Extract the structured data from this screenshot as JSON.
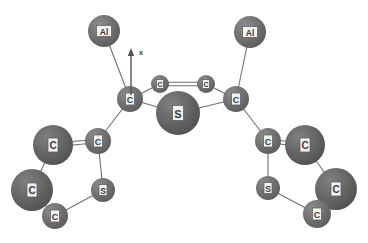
{
  "figure": {
    "type": "ball-and-stick-molecular-model",
    "width": 368,
    "height": 243,
    "background_color": "#ffffff"
  },
  "axis": {
    "label": "x",
    "label_x": 141,
    "label_y": 52,
    "arrow_tail_x": 131,
    "arrow_tail_y": 95,
    "arrow_tip_x": 131,
    "arrow_tip_y": 48,
    "color": "#555555"
  },
  "style": {
    "atom_fill_color": "#6e6e6e",
    "atom_fill_color_dark": "#636363",
    "bond_color": "#6f6f6f",
    "label_box_fill": "#f2f2f2",
    "label_text_color": "#3a3a3a"
  },
  "atoms": [
    {
      "id": "al-left",
      "element": "Al",
      "label": "Al",
      "x": 104,
      "y": 31,
      "r": 16,
      "font_size": 8.5,
      "box_w": 15,
      "box_h": 11,
      "shade": "#6e6e6e"
    },
    {
      "id": "al-right",
      "element": "Al",
      "label": "Al",
      "x": 250,
      "y": 32,
      "r": 16,
      "font_size": 8.5,
      "box_w": 15,
      "box_h": 11,
      "shade": "#6e6e6e"
    },
    {
      "id": "c-core-left",
      "element": "C",
      "label": "C",
      "x": 130,
      "y": 99,
      "r": 13,
      "font_size": 9,
      "box_w": 9,
      "box_h": 12,
      "shade": "#6e6e6e"
    },
    {
      "id": "c-core-right",
      "element": "C",
      "label": "C",
      "x": 236,
      "y": 99,
      "r": 13,
      "font_size": 9,
      "box_w": 9,
      "box_h": 12,
      "shade": "#6e6e6e"
    },
    {
      "id": "c-ring-top-left",
      "element": "C",
      "label": "C",
      "x": 160,
      "y": 84,
      "r": 9,
      "font_size": 7,
      "box_w": 7,
      "box_h": 9,
      "shade": "#6e6e6e"
    },
    {
      "id": "c-ring-top-right",
      "element": "C",
      "label": "C",
      "x": 206,
      "y": 84,
      "r": 9,
      "font_size": 7,
      "box_w": 7,
      "box_h": 9,
      "shade": "#6e6e6e"
    },
    {
      "id": "s-center",
      "element": "S",
      "label": "S",
      "x": 178,
      "y": 113,
      "r": 22,
      "font_size": 11,
      "box_w": 11,
      "box_h": 15,
      "shade": "#636363"
    },
    {
      "id": "c-left-beta",
      "element": "C",
      "label": "C",
      "x": 98,
      "y": 141,
      "r": 13,
      "font_size": 9,
      "box_w": 9,
      "box_h": 12,
      "shade": "#6e6e6e"
    },
    {
      "id": "c-left-alpha",
      "element": "C",
      "label": "C",
      "x": 53,
      "y": 145,
      "r": 20,
      "font_size": 10,
      "box_w": 10,
      "box_h": 14,
      "shade": "#636363"
    },
    {
      "id": "c-left-gamma",
      "element": "C",
      "label": "C",
      "x": 32,
      "y": 190,
      "r": 21,
      "font_size": 10,
      "box_w": 10,
      "box_h": 14,
      "shade": "#636363"
    },
    {
      "id": "c-left-delta",
      "element": "C",
      "label": "C",
      "x": 55,
      "y": 216,
      "r": 13,
      "font_size": 9,
      "box_w": 9,
      "box_h": 12,
      "shade": "#6e6e6e"
    },
    {
      "id": "s-left",
      "element": "S",
      "label": "S",
      "x": 103,
      "y": 190,
      "r": 12,
      "font_size": 8.5,
      "box_w": 8,
      "box_h": 11,
      "shade": "#6e6e6e"
    },
    {
      "id": "c-right-beta",
      "element": "C",
      "label": "C",
      "x": 268,
      "y": 141,
      "r": 13,
      "font_size": 9,
      "box_w": 9,
      "box_h": 12,
      "shade": "#6e6e6e"
    },
    {
      "id": "c-right-alpha",
      "element": "C",
      "label": "C",
      "x": 305,
      "y": 145,
      "r": 20,
      "font_size": 10,
      "box_w": 10,
      "box_h": 14,
      "shade": "#636363"
    },
    {
      "id": "c-right-gamma",
      "element": "C",
      "label": "C",
      "x": 336,
      "y": 189,
      "r": 21,
      "font_size": 10,
      "box_w": 10,
      "box_h": 14,
      "shade": "#636363"
    },
    {
      "id": "c-right-delta",
      "element": "C",
      "label": "C",
      "x": 317,
      "y": 214,
      "r": 14,
      "font_size": 9,
      "box_w": 9,
      "box_h": 12,
      "shade": "#636363"
    },
    {
      "id": "s-right",
      "element": "S",
      "label": "S",
      "x": 268,
      "y": 188,
      "r": 12,
      "font_size": 8.5,
      "box_w": 8,
      "box_h": 11,
      "shade": "#6e6e6e"
    }
  ],
  "bonds": [
    {
      "id": "b-al-left",
      "from": "al-left",
      "to": "c-core-left",
      "order": 1
    },
    {
      "id": "b-al-right",
      "from": "al-right",
      "to": "c-core-right",
      "order": 1
    },
    {
      "id": "b-core-l-ringtop",
      "from": "c-core-left",
      "to": "c-ring-top-left",
      "order": 1
    },
    {
      "id": "b-core-l-s",
      "from": "c-core-left",
      "to": "s-center",
      "order": 1
    },
    {
      "id": "b-ringtop-double",
      "from": "c-ring-top-left",
      "to": "c-ring-top-right",
      "order": 2
    },
    {
      "id": "b-core-r-ringtop",
      "from": "c-ring-top-right",
      "to": "c-core-right",
      "order": 1
    },
    {
      "id": "b-core-r-s",
      "from": "s-center",
      "to": "c-core-right",
      "order": 1
    },
    {
      "id": "b-core-l-beta",
      "from": "c-core-left",
      "to": "c-left-beta",
      "order": 1
    },
    {
      "id": "b-l-beta-alpha",
      "from": "c-left-beta",
      "to": "c-left-alpha",
      "order": 2
    },
    {
      "id": "b-l-alpha-gamma",
      "from": "c-left-alpha",
      "to": "c-left-gamma",
      "order": 1
    },
    {
      "id": "b-l-gamma-delta",
      "from": "c-left-gamma",
      "to": "c-left-delta",
      "order": 1
    },
    {
      "id": "b-l-delta-s",
      "from": "c-left-delta",
      "to": "s-left",
      "order": 1
    },
    {
      "id": "b-l-s-beta",
      "from": "s-left",
      "to": "c-left-beta",
      "order": 1
    },
    {
      "id": "b-core-r-beta",
      "from": "c-core-right",
      "to": "c-right-beta",
      "order": 1
    },
    {
      "id": "b-r-beta-alpha",
      "from": "c-right-beta",
      "to": "c-right-alpha",
      "order": 2
    },
    {
      "id": "b-r-alpha-gamma",
      "from": "c-right-alpha",
      "to": "c-right-gamma",
      "order": 1
    },
    {
      "id": "b-r-gamma-delta",
      "from": "c-right-gamma",
      "to": "c-right-delta",
      "order": 1
    },
    {
      "id": "b-r-delta-s",
      "from": "c-right-delta",
      "to": "s-right",
      "order": 1
    },
    {
      "id": "b-r-s-beta",
      "from": "s-right",
      "to": "c-right-beta",
      "order": 1
    }
  ]
}
